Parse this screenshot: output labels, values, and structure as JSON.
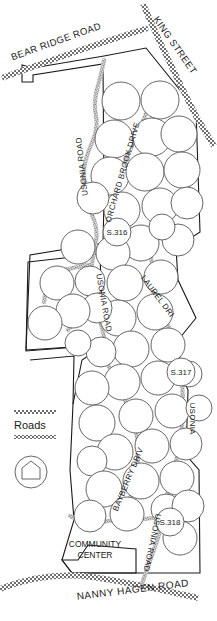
{
  "map": {
    "title": "Usonia Community Site Plan",
    "background_color": "#ffffff",
    "outline_color": "#1a1a1a",
    "road_color": "#7a7a7a",
    "lot_color": "#555555",
    "roads": [
      {
        "id": "bear-ridge-road",
        "name": "BEAR RIDGE ROAD"
      },
      {
        "id": "king-street",
        "name": "KING STREET"
      },
      {
        "id": "usonia-road-north",
        "name": "USONIA ROAD"
      },
      {
        "id": "orchard-brook-drive",
        "name": "ORCHARD BROOK DRIVE"
      },
      {
        "id": "laurel-drive",
        "name": "LAUREL DRIVE"
      },
      {
        "id": "usonia-road-mid",
        "name": "USONIA ROAD"
      },
      {
        "id": "usonia-east",
        "name": "USONIA"
      },
      {
        "id": "bayberry-drive",
        "name": "BAYBERRY DRIVE"
      },
      {
        "id": "usonia-road-south",
        "name": "USONIA ROAD"
      },
      {
        "id": "nanny-hagen-road",
        "name": "NANNY HAGEN ROAD"
      }
    ],
    "site_markers": [
      {
        "id": "s316",
        "label": "S.316"
      },
      {
        "id": "s317",
        "label": "S.317"
      },
      {
        "id": "s318",
        "label": "S.318"
      }
    ],
    "places": [
      {
        "id": "community-center",
        "line1": "COMMUNITY",
        "line2": "CENTER"
      }
    ],
    "legend": {
      "roads_label": "Roads",
      "house_symbol_name": "house-in-circle-symbol"
    }
  }
}
